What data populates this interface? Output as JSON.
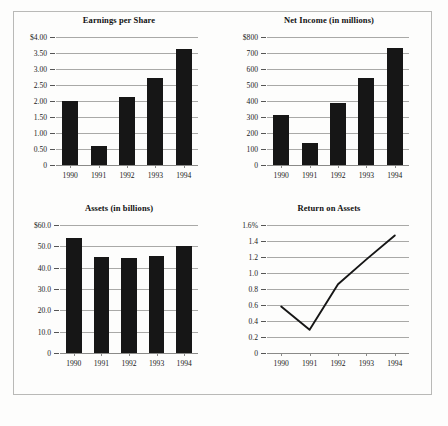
{
  "document": {
    "kind": "financial-highlights-figure",
    "background": "#fdfdfc",
    "frame_color": "#b9b9b7",
    "ink_color": "#161616",
    "gridline_color": "#a9a9a7"
  },
  "chart_data": [
    {
      "id": "earnings-per-share",
      "type": "bar",
      "title": "Earnings per Share",
      "xlabel": "",
      "ylabel": "",
      "categories": [
        "1990",
        "1991",
        "1992",
        "1993",
        "1994"
      ],
      "values": [
        2.0,
        0.58,
        2.12,
        2.72,
        3.63
      ],
      "ylim": [
        0,
        4.0
      ],
      "yticks": [
        0,
        0.5,
        1.0,
        1.5,
        2.0,
        2.5,
        3.0,
        3.5,
        4.0
      ],
      "yticklabels": [
        "0",
        "0.50",
        "1.00",
        "1.50",
        "2.00",
        "2.50",
        "3.00",
        "3.50",
        "$4.00"
      ],
      "grid": true,
      "legend": false
    },
    {
      "id": "net-income",
      "type": "bar",
      "title": "Net Income (in millions)",
      "xlabel": "",
      "ylabel": "",
      "categories": [
        "1990",
        "1991",
        "1992",
        "1993",
        "1994"
      ],
      "values": [
        315,
        137,
        388,
        545,
        733
      ],
      "ylim": [
        0,
        800
      ],
      "yticks": [
        0,
        100,
        200,
        300,
        400,
        500,
        600,
        700,
        800
      ],
      "yticklabels": [
        "0",
        "100",
        "200",
        "300",
        "400",
        "500",
        "600",
        "700",
        "$800"
      ],
      "grid": true,
      "legend": false
    },
    {
      "id": "assets",
      "type": "bar",
      "title": "Assets (in billions)",
      "xlabel": "",
      "ylabel": "",
      "categories": [
        "1990",
        "1991",
        "1992",
        "1993",
        "1994"
      ],
      "values": [
        53.8,
        45.2,
        44.6,
        45.5,
        50.2
      ],
      "ylim": [
        0,
        60.0
      ],
      "yticks": [
        0,
        10,
        20,
        30,
        40,
        50,
        60
      ],
      "yticklabels": [
        "0",
        "10.0",
        "20.0",
        "30.0",
        "40.0",
        "50.0",
        "$60.0"
      ],
      "grid": true,
      "legend": false
    },
    {
      "id": "return-on-assets",
      "type": "line",
      "title": "Return on Assets",
      "xlabel": "",
      "ylabel": "",
      "categories": [
        "1990",
        "1991",
        "1992",
        "1993",
        "1994"
      ],
      "values": [
        0.58,
        0.29,
        0.86,
        1.17,
        1.47
      ],
      "ylim": [
        0,
        1.6
      ],
      "yticks": [
        0,
        0.2,
        0.4,
        0.6,
        0.8,
        1.0,
        1.2,
        1.4,
        1.6
      ],
      "yticklabels": [
        "0",
        "0.2",
        "0.4",
        "0.6",
        "0.8",
        "1.0",
        "1.2",
        "1.4",
        "1.6%"
      ],
      "grid": true,
      "legend": false
    }
  ]
}
